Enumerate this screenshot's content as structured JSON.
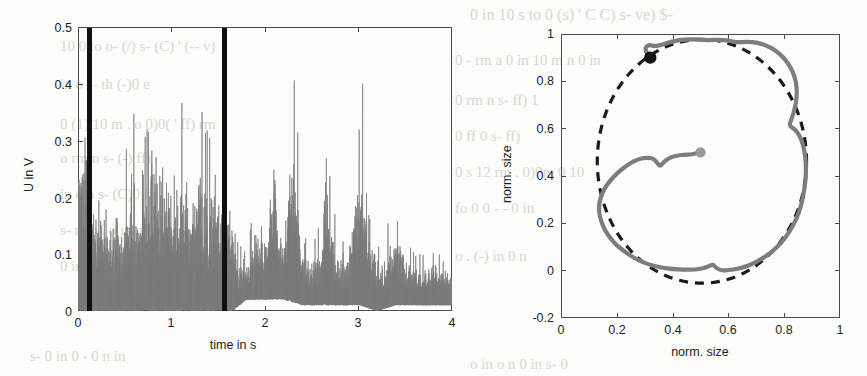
{
  "page": {
    "background_color": "#fcfcfa",
    "width": 867,
    "height": 376
  },
  "ghost_text": [
    {
      "text": "0 in 10 s to 0 (s) ' C C) s- ve) $-",
      "x": 470,
      "y": 6,
      "size": 16
    },
    {
      "text": "10 0 to o- (/) s- (C) ' (-- v)",
      "x": 60,
      "y": 38,
      "size": 15
    },
    {
      "text": "0 - rm   a  0 in 10 m  n  0 in",
      "x": 455,
      "y": 52,
      "size": 15
    },
    {
      "text": "in   o    s-    th     (-)0   e",
      "x": 60,
      "y": 76,
      "size": 15
    },
    {
      "text": "0   rm    n   s-   ff)   1",
      "x": 455,
      "y": 92,
      "size": 15
    },
    {
      "text": "0 (1)  10 m  . o 0)0(  ' ff)  rm",
      "x": 60,
      "y": 116,
      "size": 15
    },
    {
      "text": "0   ff  0    s-    ff)",
      "x": 455,
      "y": 128,
      "size": 15
    },
    {
      "text": "o   rm    n   s-    (-)     ff)",
      "x": 60,
      "y": 150,
      "size": 15
    },
    {
      "text": "0   s 12   rm  . 0)0m    0 10",
      "x": 455,
      "y": 164,
      "size": 15
    },
    {
      "text": "in  o     n   s-    (C)0     ff)",
      "x": 60,
      "y": 186,
      "size": 15
    },
    {
      "text": "fo   0  0     -   - 0  in",
      "x": 455,
      "y": 200,
      "size": 15
    },
    {
      "text": "s-  m  o    .  o   in   n  ' m",
      "x": 60,
      "y": 222,
      "size": 15
    },
    {
      "text": "0  in  o  s-  0 rm  ff)  in  n  0",
      "x": 60,
      "y": 258,
      "size": 15
    },
    {
      "text": "o   .  (-)   in   0   n",
      "x": 455,
      "y": 248,
      "size": 15
    },
    {
      "text": "s-  0  in 0  -  0  n  in",
      "x": 30,
      "y": 348,
      "size": 15
    },
    {
      "text": "o  in  o  n  0  in  s-  0",
      "x": 470,
      "y": 356,
      "size": 15
    }
  ],
  "left_plot": {
    "name": "signal-time-plot",
    "xlabel": "time in s",
    "ylabel": "U in V",
    "xticks": [
      "0",
      "1",
      "2",
      "3",
      "4"
    ],
    "xtickvals": [
      0,
      1,
      2,
      3,
      4
    ],
    "yticks": [
      "0",
      "0.1",
      "0.2",
      "0.3",
      "0.4",
      "0.5"
    ],
    "ytickvals": [
      0,
      0.1,
      0.2,
      0.3,
      0.4,
      0.5
    ],
    "xlim": [
      0,
      4
    ],
    "ylim": [
      0,
      0.5
    ],
    "trace_color": "#7d7d7d",
    "marker_color": "#101010",
    "marker_times": [
      0.105,
      1.655
    ]
  },
  "right_plot": {
    "name": "normalized-shape-plot",
    "xlabel": "norm. size",
    "ylabel": "norm. size",
    "xticks": [
      "0",
      "0.2",
      "0.4",
      "0.6",
      "0.8",
      "1"
    ],
    "xtickvals": [
      0,
      0.2,
      0.4,
      0.6,
      0.8,
      1
    ],
    "yticks": [
      "-0.2",
      "0",
      "0.2",
      "0.4",
      "0.6",
      "0.8",
      "1"
    ],
    "ytickvals": [
      -0.2,
      0,
      0.2,
      0.4,
      0.6,
      0.8,
      1
    ],
    "xlim": [
      0,
      1
    ],
    "ylim": [
      -0.2,
      1
    ],
    "contour_color": "#7d7d7d",
    "reference_color": "#1a1a1a",
    "start_marker_color": "#9a9a9a",
    "end_marker_color": "#141414",
    "start_marker": {
      "x": 0.5,
      "y": 0.5
    },
    "end_marker": {
      "x": 0.32,
      "y": 0.9
    }
  },
  "chart_data": [
    {
      "type": "line",
      "id": "left",
      "title": "",
      "xlabel": "time in s",
      "ylabel": "U in V",
      "xlim": [
        0,
        4
      ],
      "ylim": [
        0,
        0.5
      ],
      "grid": false,
      "legend": "none",
      "annotations": [
        {
          "kind": "vertical-marker",
          "x": 0.105,
          "color": "#101010"
        },
        {
          "kind": "vertical-marker",
          "x": 1.655,
          "color": "#101010"
        }
      ],
      "description": "Noisy voltage signal envelope over 4 s; dense high-amplitude burst region 0.1-1.65 s reaching up to 0.5 V, followed by sparser bursts with peaks near 2.1, 2.3, 2.65, 3.05 and 3.4 s.",
      "series": [
        {
          "name": "U",
          "envelope_upper": [
            [
              0.0,
              0.3
            ],
            [
              0.05,
              0.32
            ],
            [
              0.1,
              0.33
            ],
            [
              0.15,
              0.29
            ],
            [
              0.2,
              0.27
            ],
            [
              0.25,
              0.29
            ],
            [
              0.3,
              0.22
            ],
            [
              0.35,
              0.2
            ],
            [
              0.4,
              0.25
            ],
            [
              0.45,
              0.26
            ],
            [
              0.5,
              0.28
            ],
            [
              0.55,
              0.3
            ],
            [
              0.6,
              0.31
            ],
            [
              0.65,
              0.33
            ],
            [
              0.7,
              0.37
            ],
            [
              0.75,
              0.34
            ],
            [
              0.8,
              0.5
            ],
            [
              0.85,
              0.38
            ],
            [
              0.9,
              0.36
            ],
            [
              0.95,
              0.39
            ],
            [
              1.0,
              0.34
            ],
            [
              1.05,
              0.35
            ],
            [
              1.1,
              0.32
            ],
            [
              1.15,
              0.36
            ],
            [
              1.2,
              0.31
            ],
            [
              1.25,
              0.33
            ],
            [
              1.3,
              0.4
            ],
            [
              1.35,
              0.33
            ],
            [
              1.4,
              0.3
            ],
            [
              1.45,
              0.34
            ],
            [
              1.5,
              0.29
            ],
            [
              1.55,
              0.31
            ],
            [
              1.6,
              0.28
            ],
            [
              1.65,
              0.27
            ],
            [
              1.7,
              0.1
            ],
            [
              1.8,
              0.09
            ],
            [
              1.9,
              0.16
            ],
            [
              2.0,
              0.15
            ],
            [
              2.05,
              0.2
            ],
            [
              2.1,
              0.31
            ],
            [
              2.15,
              0.16
            ],
            [
              2.2,
              0.13
            ],
            [
              2.25,
              0.26
            ],
            [
              2.3,
              0.34
            ],
            [
              2.35,
              0.28
            ],
            [
              2.4,
              0.12
            ],
            [
              2.5,
              0.09
            ],
            [
              2.6,
              0.14
            ],
            [
              2.65,
              0.3
            ],
            [
              2.7,
              0.18
            ],
            [
              2.8,
              0.1
            ],
            [
              2.9,
              0.12
            ],
            [
              2.95,
              0.22
            ],
            [
              3.0,
              0.26
            ],
            [
              3.05,
              0.34
            ],
            [
              3.1,
              0.2
            ],
            [
              3.2,
              0.09
            ],
            [
              3.3,
              0.11
            ],
            [
              3.4,
              0.17
            ],
            [
              3.45,
              0.15
            ],
            [
              3.5,
              0.11
            ],
            [
              3.6,
              0.09
            ],
            [
              3.7,
              0.09
            ],
            [
              3.8,
              0.1
            ],
            [
              3.9,
              0.09
            ],
            [
              4.0,
              0.09
            ]
          ],
          "envelope_lower": [
            [
              0.0,
              0.0
            ],
            [
              0.2,
              0.0
            ],
            [
              0.4,
              0.0
            ],
            [
              0.6,
              0.0
            ],
            [
              0.8,
              0.0
            ],
            [
              1.0,
              0.0
            ],
            [
              1.2,
              0.0
            ],
            [
              1.4,
              0.0
            ],
            [
              1.6,
              0.0
            ],
            [
              1.65,
              0.0
            ],
            [
              1.8,
              0.02
            ],
            [
              2.0,
              0.02
            ],
            [
              2.2,
              0.02
            ],
            [
              2.4,
              0.01
            ],
            [
              2.6,
              0.01
            ],
            [
              2.8,
              0.01
            ],
            [
              3.0,
              0.01
            ],
            [
              3.2,
              0.0
            ],
            [
              3.4,
              0.01
            ],
            [
              3.6,
              0.01
            ],
            [
              3.8,
              0.01
            ],
            [
              4.0,
              0.01
            ]
          ]
        }
      ]
    },
    {
      "type": "line",
      "id": "right",
      "title": "",
      "xlabel": "norm. size",
      "ylabel": "norm. size",
      "xlim": [
        0,
        1
      ],
      "ylim": [
        -0.2,
        1
      ],
      "grid": false,
      "legend": "none",
      "description": "Closed contour (solid gray) of a normalized shape compared with a dashed reference ellipse; a gray start marker sits at the centre (0.5, 0.5) with a radial tail leading to the contour, and a black end marker sits on the contour near (0.32, 0.90).",
      "series": [
        {
          "name": "traced contour",
          "style": "solid",
          "color": "#7d7d7d",
          "points": [
            [
              0.5,
              0.5
            ],
            [
              0.47,
              0.49
            ],
            [
              0.44,
              0.49
            ],
            [
              0.41,
              0.485
            ],
            [
              0.385,
              0.475
            ],
            [
              0.365,
              0.455
            ],
            [
              0.355,
              0.44
            ],
            [
              0.345,
              0.455
            ],
            [
              0.335,
              0.47
            ],
            [
              0.325,
              0.475
            ],
            [
              0.3,
              0.478
            ],
            [
              0.275,
              0.47
            ],
            [
              0.25,
              0.455
            ],
            [
              0.225,
              0.435
            ],
            [
              0.2,
              0.41
            ],
            [
              0.175,
              0.38
            ],
            [
              0.155,
              0.345
            ],
            [
              0.142,
              0.31
            ],
            [
              0.136,
              0.275
            ],
            [
              0.137,
              0.24
            ],
            [
              0.145,
              0.205
            ],
            [
              0.158,
              0.17
            ],
            [
              0.175,
              0.14
            ],
            [
              0.195,
              0.112
            ],
            [
              0.22,
              0.088
            ],
            [
              0.25,
              0.062
            ],
            [
              0.285,
              0.04
            ],
            [
              0.32,
              0.024
            ],
            [
              0.36,
              0.013
            ],
            [
              0.4,
              0.007
            ],
            [
              0.44,
              0.004
            ],
            [
              0.48,
              0.004
            ],
            [
              0.52,
              0.012
            ],
            [
              0.545,
              0.028
            ],
            [
              0.555,
              0.012
            ],
            [
              0.575,
              0.0
            ],
            [
              0.6,
              0.002
            ],
            [
              0.635,
              0.008
            ],
            [
              0.675,
              0.022
            ],
            [
              0.715,
              0.046
            ],
            [
              0.755,
              0.078
            ],
            [
              0.79,
              0.118
            ],
            [
              0.82,
              0.165
            ],
            [
              0.845,
              0.22
            ],
            [
              0.862,
              0.28
            ],
            [
              0.872,
              0.34
            ],
            [
              0.878,
              0.4
            ],
            [
              0.878,
              0.455
            ],
            [
              0.872,
              0.51
            ],
            [
              0.862,
              0.555
            ],
            [
              0.845,
              0.59
            ],
            [
              0.828,
              0.605
            ],
            [
              0.818,
              0.615
            ],
            [
              0.828,
              0.645
            ],
            [
              0.838,
              0.685
            ],
            [
              0.845,
              0.73
            ],
            [
              0.845,
              0.775
            ],
            [
              0.838,
              0.82
            ],
            [
              0.822,
              0.862
            ],
            [
              0.8,
              0.898
            ],
            [
              0.772,
              0.928
            ],
            [
              0.74,
              0.95
            ],
            [
              0.705,
              0.963
            ],
            [
              0.668,
              0.968
            ],
            [
              0.63,
              0.964
            ],
            [
              0.6,
              0.972
            ],
            [
              0.565,
              0.976
            ],
            [
              0.53,
              0.974
            ],
            [
              0.495,
              0.976
            ],
            [
              0.46,
              0.978
            ],
            [
              0.425,
              0.974
            ],
            [
              0.39,
              0.966
            ],
            [
              0.36,
              0.954
            ],
            [
              0.335,
              0.948
            ],
            [
              0.315,
              0.955
            ],
            [
              0.302,
              0.942
            ],
            [
              0.305,
              0.925
            ],
            [
              0.315,
              0.908
            ],
            [
              0.32,
              0.9
            ]
          ]
        },
        {
          "name": "reference ellipse",
          "style": "dashed",
          "color": "#1a1a1a",
          "center": [
            0.505,
            0.462
          ],
          "semi_axes": [
            0.375,
            0.515
          ]
        }
      ]
    }
  ]
}
